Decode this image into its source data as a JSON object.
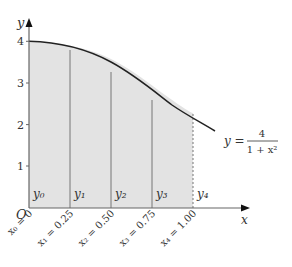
{
  "diagram": {
    "function_label": {
      "lhs": "y =",
      "numerator": "4",
      "denominator": "1 + x²"
    },
    "axes": {
      "x_label": "x",
      "y_label": "y",
      "origin_label": "O"
    },
    "y_ticks": [
      {
        "label": "1",
        "value": 1
      },
      {
        "label": "2",
        "value": 2
      },
      {
        "label": "3",
        "value": 3
      },
      {
        "label": "4",
        "value": 4
      }
    ],
    "x_points": [
      {
        "label": "x₀ = 0",
        "value": 0,
        "ordinate": "y₀"
      },
      {
        "label": "x₁ = 0.25",
        "value": 0.25,
        "ordinate": "y₁"
      },
      {
        "label": "x₂ = 0.50",
        "value": 0.5,
        "ordinate": "y₂"
      },
      {
        "label": "x₃ = 0.75",
        "value": 0.75,
        "ordinate": "y₃"
      },
      {
        "label": "x₄ = 1.00",
        "value": 1.0,
        "ordinate": "y₄"
      }
    ],
    "colors": {
      "fill": "#e3e3e3",
      "curve": "#222222",
      "axis": "#666666"
    }
  }
}
